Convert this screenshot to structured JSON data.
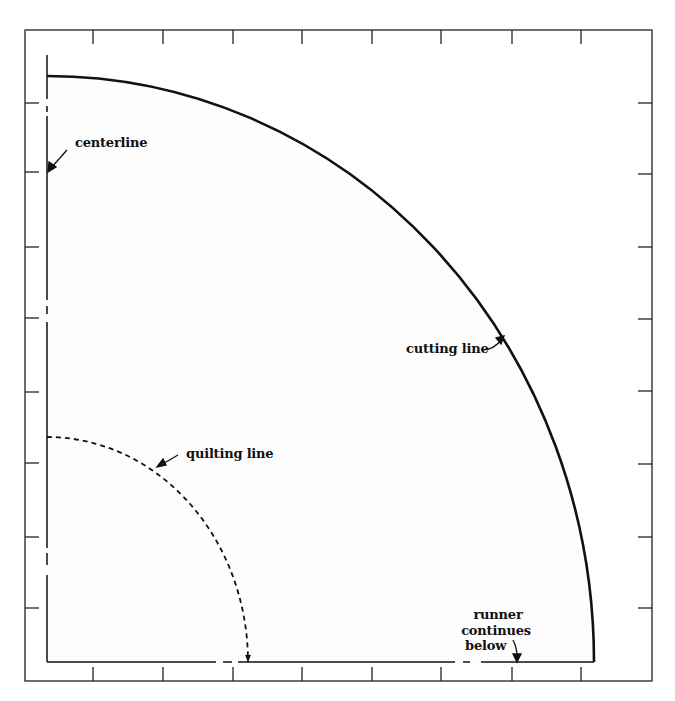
{
  "figure": {
    "type": "quilt pattern template (quarter-circle runner end)",
    "colors": {
      "ink": "#111111",
      "paper": "#ffffff",
      "fill": "#fdfdfd"
    }
  },
  "labels": {
    "centerline": "centerline",
    "cutting_line": "cutting line",
    "quilting_line": "quilting line",
    "runner_line1": "runner",
    "runner_line2": "continues",
    "runner_line3": "below"
  },
  "grid": {
    "frame": {
      "left": 25,
      "top": 30,
      "right": 652,
      "bottom": 681
    },
    "top_ticks_x": [
      93,
      163,
      233,
      302,
      372,
      441,
      512,
      581
    ],
    "bottom_ticks_x": [
      93,
      163,
      233,
      302,
      372,
      441,
      512,
      581
    ],
    "left_ticks_y": [
      103,
      172,
      247,
      318,
      392,
      463,
      537,
      608
    ],
    "right_ticks_y": [
      103,
      174,
      247,
      319,
      391,
      464,
      537,
      608
    ],
    "tick_length": 14
  },
  "pattern": {
    "origin": {
      "x": 47,
      "y": 662
    },
    "cutting_arc": {
      "rx": 547,
      "ry": 586
    },
    "quilting_arc": {
      "rx": 201,
      "ry": 225
    }
  }
}
